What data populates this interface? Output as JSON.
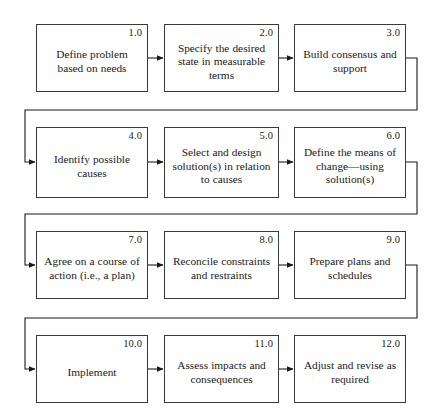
{
  "diagram": {
    "type": "flowchart",
    "layout": {
      "rows": 4,
      "columns": 3,
      "flow": "serpentine-left-to-right"
    },
    "colors": {
      "box_border": "#3a3a3a",
      "connector": "#1a1a1a",
      "background": "#ffffff",
      "text": "#1a1a1a"
    },
    "steps": [
      {
        "number": "1.0",
        "label": "Define problem based on needs"
      },
      {
        "number": "2.0",
        "label": "Specify the desired state in measurable terms"
      },
      {
        "number": "3.0",
        "label": "Build consensus and support"
      },
      {
        "number": "4.0",
        "label": "Identify possible causes"
      },
      {
        "number": "5.0",
        "label": "Select and design solution(s) in relation to causes"
      },
      {
        "number": "6.0",
        "label": "Define the means of change—using solution(s)"
      },
      {
        "number": "7.0",
        "label": "Agree on a course of action (i.e., a plan)"
      },
      {
        "number": "8.0",
        "label": "Reconcile constraints and restraints"
      },
      {
        "number": "9.0",
        "label": "Prepare plans and schedules"
      },
      {
        "number": "10.0",
        "label": "Implement"
      },
      {
        "number": "11.0",
        "label": "Assess impacts and consequences"
      },
      {
        "number": "12.0",
        "label": "Adjust and revise as required"
      }
    ],
    "connectors": {
      "inline_arrows": [
        {
          "from": "1.0",
          "to": "2.0"
        },
        {
          "from": "2.0",
          "to": "3.0"
        },
        {
          "from": "4.0",
          "to": "5.0"
        },
        {
          "from": "5.0",
          "to": "6.0"
        },
        {
          "from": "7.0",
          "to": "8.0"
        },
        {
          "from": "8.0",
          "to": "9.0"
        },
        {
          "from": "10.0",
          "to": "11.0"
        },
        {
          "from": "11.0",
          "to": "12.0"
        }
      ],
      "wrap_arrows": [
        {
          "from": "3.0",
          "to": "4.0"
        },
        {
          "from": "6.0",
          "to": "7.0"
        },
        {
          "from": "9.0",
          "to": "10.0"
        }
      ]
    }
  }
}
